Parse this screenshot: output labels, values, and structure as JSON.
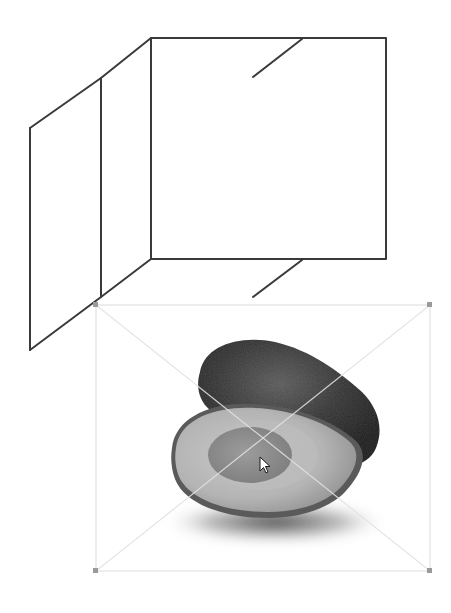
{
  "canvas": {
    "width": 451,
    "height": 613,
    "background": "#ffffff",
    "wireframe_color": "#3a3a3a",
    "selection_color": "#d4d4d4",
    "handle_color": "#9a9a9a"
  },
  "wireframe": {
    "label": "perspective box drawing",
    "front_face": {
      "x1": 151,
      "y1": 38,
      "x2": 386,
      "y2": 259
    },
    "side_panel": {
      "outer_top": [
        30,
        128
      ],
      "outer_bottom": [
        30,
        350
      ],
      "inner_x": 101,
      "inner_top": [
        101,
        78
      ],
      "inner_bottom": [
        101,
        297
      ]
    },
    "slashes": [
      {
        "from": [
          302,
          39
        ],
        "to": [
          253,
          77
        ]
      },
      {
        "from": [
          302,
          260
        ],
        "to": [
          253,
          297
        ]
      }
    ]
  },
  "placed_image": {
    "subject": "avocado",
    "description": "Halved avocado in grayscale with whole avocado behind it",
    "bounds": {
      "x1": 96,
      "y1": 305,
      "x2": 430,
      "y2": 571
    }
  },
  "selection": {
    "handles": [
      "top-left",
      "top-right",
      "bottom-left",
      "bottom-right"
    ],
    "crosshair": "diagonal"
  },
  "cursor": {
    "type": "arrow-pointer",
    "x": 260,
    "y": 457
  }
}
